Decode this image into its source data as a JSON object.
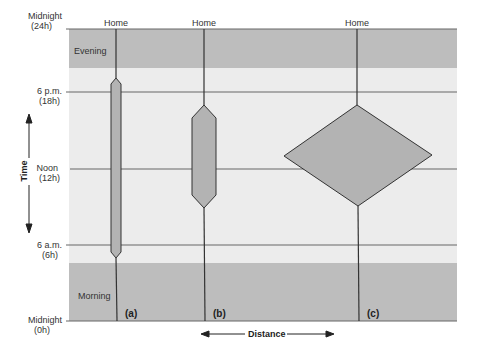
{
  "diagram": {
    "title": "",
    "y_axis_label": "Time",
    "x_axis_label": "Distance",
    "time_ticks": [
      {
        "label": "Midnight",
        "sub": "(24h)"
      },
      {
        "label": "6 p.m.",
        "sub": "(18h)"
      },
      {
        "label": "Noon",
        "sub": "(12h)"
      },
      {
        "label": "6 a.m.",
        "sub": "(6h)"
      },
      {
        "label": "Midnight",
        "sub": "(0h)"
      }
    ],
    "bands": {
      "evening": "Evening",
      "morning": "Morning"
    },
    "paths": [
      {
        "id": "a",
        "home_label": "Home",
        "panel_label": "(a)",
        "shape": "narrow-elongated-hexagon"
      },
      {
        "id": "b",
        "home_label": "Home",
        "panel_label": "(b)",
        "shape": "medium-hexagon"
      },
      {
        "id": "c",
        "home_label": "Home",
        "panel_label": "(c)",
        "shape": "wide-diamond"
      }
    ],
    "colors": {
      "band_dark": "#bdbdbd",
      "band_light": "#ececec",
      "shape_fill": "#b3b3b3",
      "line": "#444444"
    }
  }
}
